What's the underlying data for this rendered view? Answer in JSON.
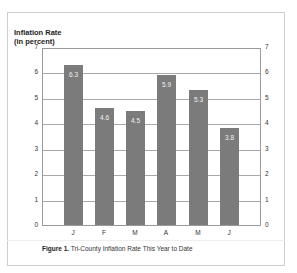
{
  "figure": {
    "y_title_line1": "Inflation Rate",
    "y_title_line2": "(in percent)",
    "caption_label": "Figure 1.",
    "caption_text": " Tri-County Inflation Rate This Year to Date"
  },
  "y_ticks": [
    "0",
    "1",
    "2",
    "3",
    "4",
    "5",
    "6",
    "7"
  ],
  "bars": [
    {
      "x": "J",
      "value": 6.3,
      "label": "6.3"
    },
    {
      "x": "F",
      "value": 4.6,
      "label": "4.6"
    },
    {
      "x": "M",
      "value": 4.5,
      "label": "4.5"
    },
    {
      "x": "A",
      "value": 5.9,
      "label": "5.9"
    },
    {
      "x": "M",
      "value": 5.3,
      "label": "5.3"
    },
    {
      "x": "J",
      "value": 3.8,
      "label": "3.8"
    }
  ],
  "colors": {
    "bar": "#7b7b7b",
    "grid": "#a8a8a8"
  },
  "chart_data": {
    "type": "bar",
    "title": "Figure 1. Tri-County Inflation Rate This Year to Date",
    "categories": [
      "J",
      "F",
      "M",
      "A",
      "M",
      "J"
    ],
    "values": [
      6.3,
      4.6,
      4.5,
      5.9,
      5.3,
      3.8
    ],
    "xlabel": "",
    "ylabel": "Inflation Rate (in percent)",
    "ylim": [
      0,
      7
    ],
    "yticks": [
      0,
      1,
      2,
      3,
      4,
      5,
      6,
      7
    ],
    "grid": true,
    "data_labels": true,
    "secondary_y_axis": true,
    "legend": null
  }
}
